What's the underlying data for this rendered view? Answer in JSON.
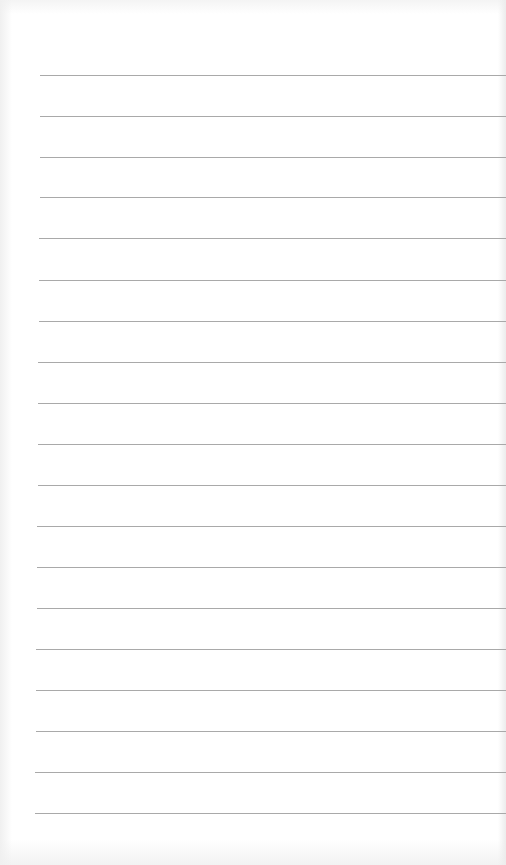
{
  "paper": {
    "type": "lined-paper",
    "background_color": "#ffffff",
    "line_color": "#a9a9a9",
    "line_count": 19,
    "line_spacing_px": 41,
    "lines": [
      {
        "y": 75,
        "x": 40
      },
      {
        "y": 116,
        "x": 40
      },
      {
        "y": 157,
        "x": 40
      },
      {
        "y": 197,
        "x": 40
      },
      {
        "y": 238,
        "x": 39
      },
      {
        "y": 280,
        "x": 39
      },
      {
        "y": 321,
        "x": 39
      },
      {
        "y": 362,
        "x": 38
      },
      {
        "y": 403,
        "x": 38
      },
      {
        "y": 444,
        "x": 38
      },
      {
        "y": 485,
        "x": 38
      },
      {
        "y": 526,
        "x": 37
      },
      {
        "y": 567,
        "x": 37
      },
      {
        "y": 608,
        "x": 37
      },
      {
        "y": 649,
        "x": 36
      },
      {
        "y": 690,
        "x": 36
      },
      {
        "y": 731,
        "x": 36
      },
      {
        "y": 772,
        "x": 35
      },
      {
        "y": 813,
        "x": 35
      }
    ]
  }
}
